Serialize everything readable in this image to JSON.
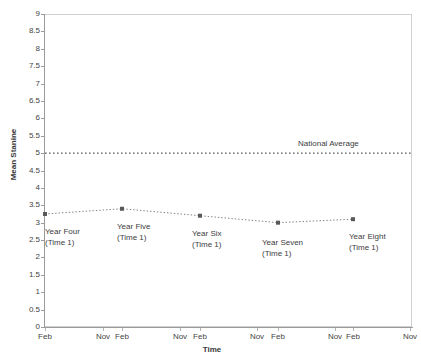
{
  "chart_data": {
    "type": "line",
    "title": "",
    "xlabel": "Time",
    "ylabel": "Mean Stanine",
    "ylim": [
      0,
      9
    ],
    "ytick_step": 0.5,
    "grid": false,
    "legend": "none",
    "yticks": [
      "9",
      "8.5",
      "8",
      "7.5",
      "7",
      "6.5",
      "6",
      "5.5",
      "5",
      "4.5",
      "4",
      "3.5",
      "3",
      "2.5",
      "2",
      "1.5",
      "1",
      "0.5",
      "0"
    ],
    "xticks": [
      "Feb",
      "Nov",
      "Feb",
      "Nov",
      "Feb",
      "Nov",
      "Feb",
      "Nov",
      "Feb",
      "Nov"
    ],
    "categories": [
      "Year Four (Time 1)",
      "Year Five (Time 1)",
      "Year Six (Time 1)",
      "Year Seven (Time 1)",
      "Year Eight (Time 1)"
    ],
    "values": [
      3.25,
      3.4,
      3.2,
      3.0,
      3.1
    ],
    "point_labels": [
      {
        "line1": "Year Four",
        "line2": "(Time 1)"
      },
      {
        "line1": "Year Five",
        "line2": "(Time 1)"
      },
      {
        "line1": "Year Six",
        "line2": "(Time 1)"
      },
      {
        "line1": "Year Seven",
        "line2": "(Time 1)"
      },
      {
        "line1": "Year Eight",
        "line2": "(Time 1)"
      }
    ],
    "annotations": [
      {
        "text": "National Average",
        "value": 5,
        "style": "dotted-reference-line"
      }
    ],
    "series_color": "#808080",
    "marker_color": "#595959",
    "reference_line_color": "#2b2b2b"
  },
  "axes": {
    "y_title": "Mean Stanine",
    "x_title": "Time"
  },
  "annotation": {
    "national_average": "National Average"
  }
}
